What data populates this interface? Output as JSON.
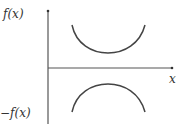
{
  "diagram": {
    "labels": {
      "y_axis_top": "f(x)",
      "y_axis_bottom": "−f(x)",
      "x_axis": "x"
    },
    "colors": {
      "axis": "#555555",
      "curve": "#444444",
      "text": "#333333"
    },
    "curves": [
      {
        "name": "upper-curve",
        "shape": "concave-up arc",
        "position": "above x-axis"
      },
      {
        "name": "lower-curve",
        "shape": "concave-down arc",
        "position": "below x-axis"
      }
    ]
  }
}
